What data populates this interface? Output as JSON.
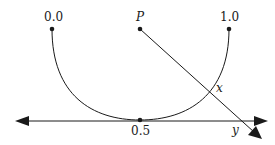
{
  "diagram": {
    "labels": {
      "left_end": "0.0",
      "right_end": "1.0",
      "bottom": "0.5",
      "point_p": "P",
      "intersection_x": "x",
      "intersection_y": "y"
    },
    "colors": {
      "stroke": "#1a1a1a",
      "background": "#ffffff"
    }
  }
}
